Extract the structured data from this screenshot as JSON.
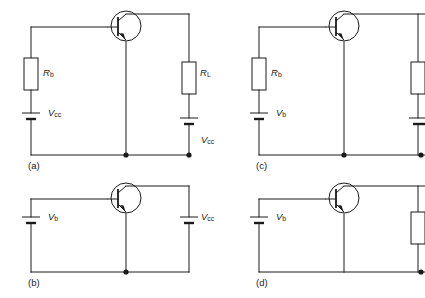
{
  "figure": {
    "background": "#ffffff",
    "line_color": "#1a1a1a",
    "width": 425,
    "height": 298
  },
  "panels": [
    {
      "id": "a",
      "caption": "(a)",
      "components": {
        "base_resistor": "R",
        "base_resistor_sub": "b",
        "base_source": "V",
        "base_source_sub": "cc",
        "load_resistor": "R",
        "load_resistor_sub": "L",
        "collector_source": "V",
        "collector_source_sub": "cc"
      }
    },
    {
      "id": "b",
      "caption": "(b)",
      "components": {
        "base_source": "V",
        "base_source_sub": "b",
        "collector_source": "V",
        "collector_source_sub": "cc"
      }
    },
    {
      "id": "c",
      "caption": "(c)",
      "components": {
        "base_resistor": "R",
        "base_resistor_sub": "b",
        "base_source": "V",
        "base_source_sub": "b"
      }
    },
    {
      "id": "d",
      "caption": "(d)",
      "components": {
        "base_source": "V",
        "base_source_sub": "b"
      }
    }
  ],
  "labels": {
    "a_Rb": "R",
    "a_Rb_sub": "b",
    "a_Vcc_left": "V",
    "a_Vcc_left_sub": "cc",
    "a_RL": "R",
    "a_RL_sub": "L",
    "a_Vcc_right": "V",
    "a_Vcc_right_sub": "cc",
    "a_caption": "(a)",
    "b_Vb": "V",
    "b_Vb_sub": "b",
    "b_Vcc": "V",
    "b_Vcc_sub": "cc",
    "b_caption": "(b)",
    "c_Rb": "R",
    "c_Rb_sub": "b",
    "c_Vb": "V",
    "c_Vb_sub": "b",
    "c_caption": "(c)",
    "d_Vb": "V",
    "d_Vb_sub": "b",
    "d_caption": "(d)"
  }
}
